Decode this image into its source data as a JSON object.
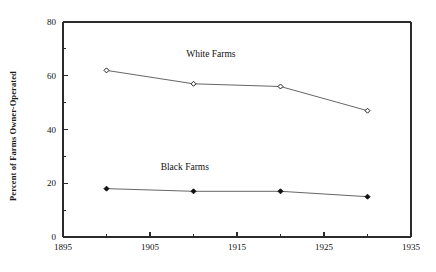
{
  "chart_data": {
    "type": "line",
    "title": "",
    "xlabel": "",
    "ylabel": "Percent of Farms Owner-Operated",
    "x": [
      1900,
      1910,
      1920,
      1930
    ],
    "xlim": [
      1895,
      1935
    ],
    "ylim": [
      0,
      80
    ],
    "x_ticks": [
      1895,
      1905,
      1915,
      1925,
      1935
    ],
    "x_tick_labels": [
      "1895",
      "1905",
      "1915",
      "1925",
      "1935"
    ],
    "x_minor_ticks": [
      1900,
      1910,
      1920,
      1930
    ],
    "y_ticks": [
      0,
      20,
      40,
      60,
      80
    ],
    "y_tick_labels": [
      "0",
      "20",
      "40",
      "60",
      "80"
    ],
    "y_minor_ticks": [
      10,
      30,
      50,
      70
    ],
    "grid": false,
    "legend_position": "inline-annotation",
    "series": [
      {
        "name": "White Farms",
        "label": "White Farms",
        "marker": "open-diamond",
        "color": "#555555",
        "label_x": 1912,
        "label_y": 67,
        "values": [
          62,
          57,
          56,
          47
        ]
      },
      {
        "name": "Black Farms",
        "label": "Black Farms",
        "marker": "filled-diamond",
        "color": "#555555",
        "label_x": 1909,
        "label_y": 25,
        "values": [
          18,
          17,
          17,
          15
        ]
      }
    ]
  },
  "axes": {
    "y_title": "Percent of Farms Owner-Operated"
  }
}
